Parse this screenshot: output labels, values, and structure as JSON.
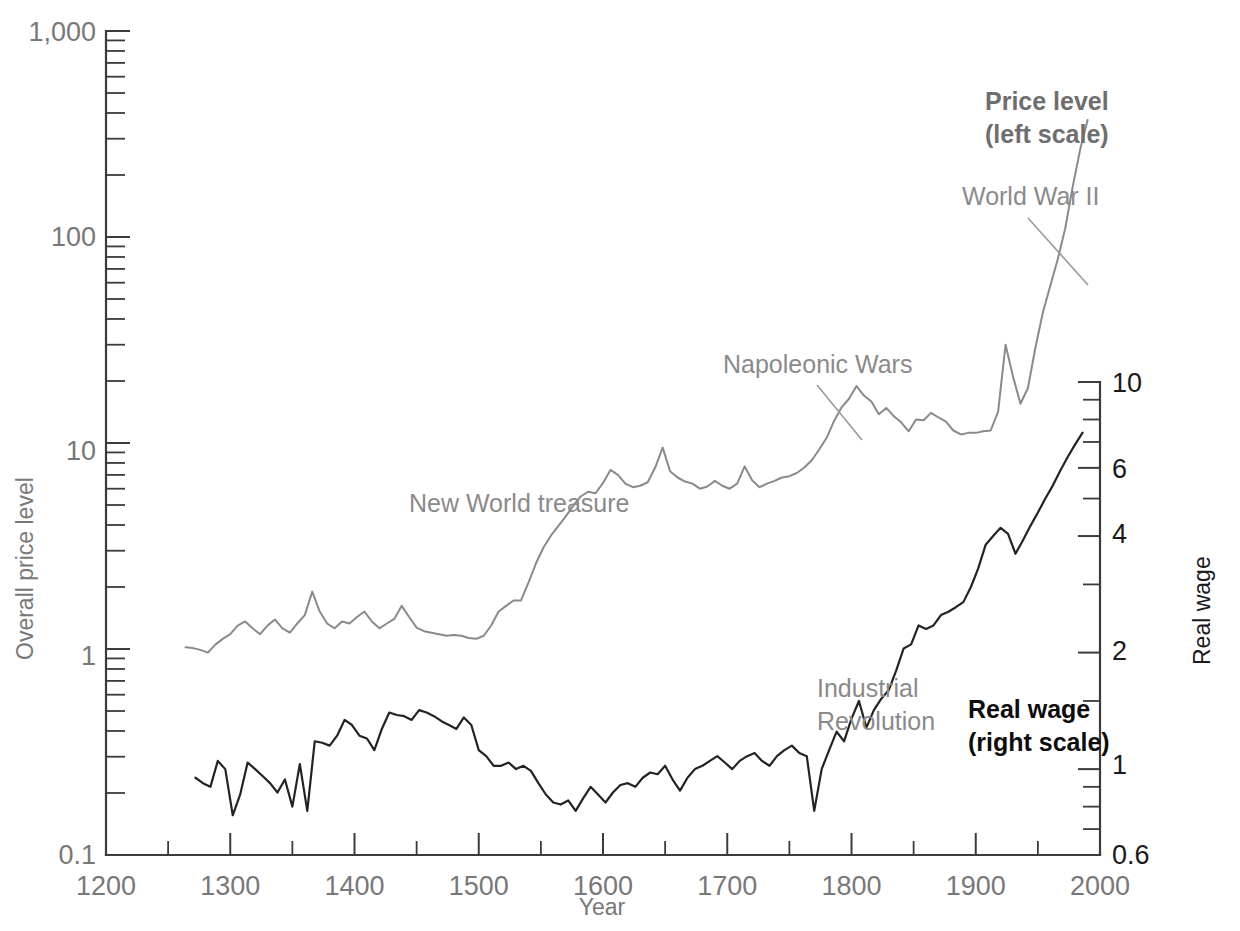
{
  "chart_data": {
    "type": "line",
    "title": "",
    "xlabel": "Year",
    "ylabel_left": "Overall price level",
    "ylabel_right": "Real wage",
    "xlim": [
      1200,
      2000
    ],
    "xticks": [
      1200,
      1300,
      1400,
      1500,
      1600,
      1700,
      1800,
      1900,
      2000
    ],
    "xticks_minor_step": 50,
    "ylim_left": [
      0.1,
      1000
    ],
    "yticks_left": [
      "0.1",
      "1",
      "10",
      "100",
      "1,000"
    ],
    "ylim_right": [
      0.6,
      10
    ],
    "yticks_right": [
      "0.6",
      "1",
      "2",
      "4",
      "6",
      "10"
    ],
    "y_scale": "log",
    "grid": false,
    "legend_position": "inline-annotations",
    "series": [
      {
        "name": "Price level (left scale)",
        "axis": "left",
        "color": "#8a8a8a",
        "x": [
          1264,
          1270,
          1276,
          1282,
          1288,
          1294,
          1300,
          1306,
          1312,
          1318,
          1324,
          1330,
          1336,
          1342,
          1348,
          1354,
          1360,
          1366,
          1372,
          1378,
          1384,
          1390,
          1396,
          1402,
          1408,
          1414,
          1420,
          1426,
          1432,
          1438,
          1444,
          1450,
          1456,
          1462,
          1468,
          1474,
          1480,
          1486,
          1492,
          1498,
          1504,
          1510,
          1516,
          1522,
          1528,
          1534,
          1540,
          1546,
          1552,
          1558,
          1564,
          1570,
          1576,
          1582,
          1588,
          1594,
          1600,
          1606,
          1612,
          1618,
          1624,
          1630,
          1636,
          1642,
          1648,
          1654,
          1660,
          1666,
          1672,
          1678,
          1684,
          1690,
          1696,
          1702,
          1708,
          1714,
          1720,
          1726,
          1732,
          1738,
          1744,
          1750,
          1756,
          1762,
          1768,
          1774,
          1780,
          1786,
          1792,
          1798,
          1804,
          1810,
          1816,
          1822,
          1828,
          1834,
          1840,
          1846,
          1852,
          1858,
          1864,
          1870,
          1876,
          1882,
          1888,
          1894,
          1900,
          1906,
          1912,
          1918,
          1924,
          1930,
          1936,
          1942,
          1948,
          1954,
          1960,
          1966,
          1972,
          1978,
          1984,
          1990
        ],
        "y": [
          1.02,
          1.01,
          0.99,
          0.96,
          1.05,
          1.12,
          1.18,
          1.3,
          1.36,
          1.26,
          1.18,
          1.3,
          1.39,
          1.26,
          1.2,
          1.33,
          1.46,
          1.9,
          1.52,
          1.33,
          1.26,
          1.36,
          1.33,
          1.43,
          1.52,
          1.36,
          1.26,
          1.33,
          1.4,
          1.62,
          1.43,
          1.27,
          1.22,
          1.2,
          1.18,
          1.16,
          1.17,
          1.16,
          1.13,
          1.12,
          1.16,
          1.3,
          1.52,
          1.62,
          1.72,
          1.72,
          2.1,
          2.6,
          3.1,
          3.55,
          3.95,
          4.4,
          4.95,
          5.5,
          5.8,
          5.7,
          6.4,
          7.4,
          7.0,
          6.35,
          6.1,
          6.2,
          6.45,
          7.6,
          9.5,
          7.3,
          6.8,
          6.5,
          6.35,
          6.0,
          6.15,
          6.55,
          6.2,
          6.0,
          6.35,
          7.7,
          6.6,
          6.1,
          6.35,
          6.55,
          6.8,
          6.9,
          7.15,
          7.6,
          8.25,
          9.3,
          10.6,
          12.8,
          14.9,
          16.4,
          18.9,
          17.0,
          15.9,
          13.8,
          14.8,
          13.5,
          12.6,
          11.4,
          13.0,
          12.9,
          14.0,
          13.3,
          12.7,
          11.5,
          11.0,
          11.2,
          11.2,
          11.4,
          11.5,
          14.2,
          30.0,
          21.0,
          15.5,
          18.5,
          29.0,
          43.0,
          58.0,
          78.0,
          110,
          175,
          265,
          370
        ]
      },
      {
        "name": "Real wage (right scale)",
        "axis": "right",
        "color": "#232323",
        "x": [
          1272,
          1278,
          1284,
          1290,
          1296,
          1302,
          1308,
          1314,
          1320,
          1326,
          1332,
          1338,
          1344,
          1350,
          1356,
          1362,
          1368,
          1374,
          1380,
          1386,
          1392,
          1398,
          1404,
          1410,
          1416,
          1422,
          1428,
          1434,
          1440,
          1446,
          1452,
          1458,
          1464,
          1470,
          1476,
          1482,
          1488,
          1494,
          1500,
          1506,
          1512,
          1518,
          1524,
          1530,
          1536,
          1542,
          1548,
          1554,
          1560,
          1566,
          1572,
          1578,
          1584,
          1590,
          1596,
          1602,
          1608,
          1614,
          1620,
          1626,
          1632,
          1638,
          1644,
          1650,
          1656,
          1662,
          1668,
          1674,
          1680,
          1686,
          1692,
          1698,
          1704,
          1710,
          1716,
          1722,
          1728,
          1734,
          1740,
          1746,
          1752,
          1758,
          1764,
          1770,
          1776,
          1782,
          1788,
          1794,
          1800,
          1806,
          1812,
          1818,
          1824,
          1830,
          1836,
          1842,
          1848,
          1854,
          1860,
          1866,
          1872,
          1878,
          1884,
          1890,
          1896,
          1902,
          1908,
          1914,
          1920,
          1926,
          1932,
          1938,
          1944,
          1950,
          1956,
          1962,
          1968,
          1974,
          1980,
          1986
        ],
        "y": [
          0.95,
          0.92,
          0.9,
          1.05,
          1.0,
          0.76,
          0.86,
          1.04,
          1.0,
          0.96,
          0.92,
          0.87,
          0.94,
          0.8,
          1.03,
          0.78,
          1.18,
          1.17,
          1.15,
          1.22,
          1.34,
          1.3,
          1.22,
          1.2,
          1.12,
          1.27,
          1.4,
          1.38,
          1.37,
          1.34,
          1.42,
          1.4,
          1.37,
          1.33,
          1.3,
          1.27,
          1.36,
          1.3,
          1.12,
          1.08,
          1.02,
          1.02,
          1.04,
          1.0,
          1.02,
          0.99,
          0.92,
          0.86,
          0.82,
          0.81,
          0.83,
          0.78,
          0.84,
          0.9,
          0.86,
          0.82,
          0.87,
          0.91,
          0.92,
          0.9,
          0.95,
          0.98,
          0.97,
          1.02,
          0.94,
          0.88,
          0.95,
          1.0,
          1.02,
          1.05,
          1.08,
          1.04,
          1.0,
          1.05,
          1.08,
          1.1,
          1.05,
          1.02,
          1.08,
          1.12,
          1.15,
          1.1,
          1.08,
          0.78,
          1.0,
          1.12,
          1.25,
          1.18,
          1.35,
          1.5,
          1.28,
          1.42,
          1.52,
          1.6,
          1.8,
          2.05,
          2.1,
          2.35,
          2.3,
          2.35,
          2.5,
          2.55,
          2.62,
          2.7,
          2.95,
          3.3,
          3.8,
          4.0,
          4.2,
          4.05,
          3.6,
          3.9,
          4.25,
          4.6,
          5.0,
          5.4,
          5.9,
          6.4,
          6.9,
          7.4
        ]
      }
    ],
    "annotations": [
      {
        "id": "price-level-label",
        "text_lines": [
          "Price level",
          "(left scale)"
        ],
        "style": "bold-gray"
      },
      {
        "id": "world-war-2-label",
        "text_lines": [
          "World War II"
        ],
        "style": "gray",
        "leader": true
      },
      {
        "id": "napoleonic-wars-label",
        "text_lines": [
          "Napoleonic Wars"
        ],
        "style": "gray",
        "leader": true
      },
      {
        "id": "new-world-treasure-label",
        "text_lines": [
          "New World treasure"
        ],
        "style": "gray"
      },
      {
        "id": "industrial-revolution-label",
        "text_lines": [
          "Industrial",
          "Revolution"
        ],
        "style": "gray"
      },
      {
        "id": "real-wage-label",
        "text_lines": [
          "Real wage",
          "(right scale)"
        ],
        "style": "bold-black"
      }
    ]
  },
  "labels": {
    "x_axis_title": "Year",
    "y_axis_left_title": "Overall price level",
    "y_axis_right_title": "Real wage",
    "x_tick_1200": "1200",
    "x_tick_1300": "1300",
    "x_tick_1400": "1400",
    "x_tick_1500": "1500",
    "x_tick_1600": "1600",
    "x_tick_1700": "1700",
    "x_tick_1800": "1800",
    "x_tick_1900": "1900",
    "x_tick_2000": "2000",
    "y_left_1000": "1,000",
    "y_left_100": "100",
    "y_left_10": "10",
    "y_left_1": "1",
    "y_left_01": "0.1",
    "y_right_10": "10",
    "y_right_6": "6",
    "y_right_4": "4",
    "y_right_2": "2",
    "y_right_1": "1",
    "y_right_06": "0.6",
    "anno_price_level_1": "Price level",
    "anno_price_level_2": "(left scale)",
    "anno_world_war_2": "World War II",
    "anno_napoleonic": "Napoleonic Wars",
    "anno_new_world": "New World treasure",
    "anno_industrial_1": "Industrial",
    "anno_industrial_2": "Revolution",
    "anno_real_wage_1": "Real wage",
    "anno_real_wage_2": "(right scale)"
  },
  "colors": {
    "price_series": "#8a8a8a",
    "wage_series": "#232323",
    "axis": "#3b3b3b",
    "tick_text": "#787878",
    "background": "#ffffff"
  }
}
